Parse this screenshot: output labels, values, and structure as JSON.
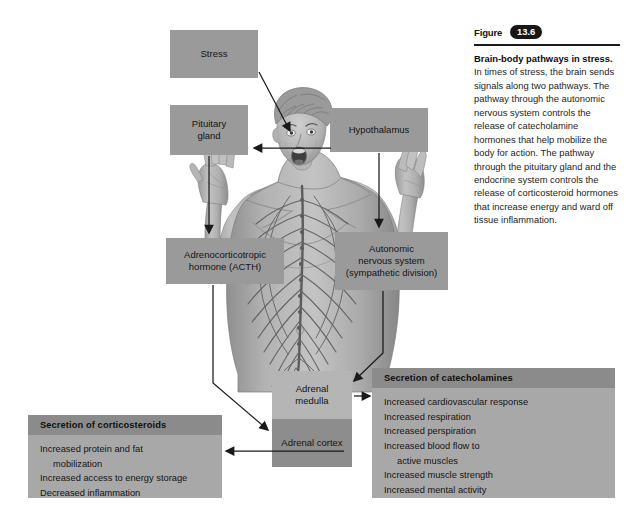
{
  "figure": {
    "label": "Figure",
    "number": "13.6",
    "title": "Brain-body pathways in stress.",
    "caption": " In times of stress, the brain sends signals along two pathways. The pathway through the autonomic nervous system controls the release of catecholamine hormones that help mobilize the body for action. The pathway through the pituitary gland and the endocrine system controls the release of corticosteroid hormones that increase energy and ward off tissue inflammation."
  },
  "diagram": {
    "boxes": {
      "stress": {
        "line1": "Stress"
      },
      "pituitary": {
        "line1": "Pituitary",
        "line2": "gland"
      },
      "hypothalamus": {
        "line1": "Hypothalamus"
      },
      "acth": {
        "line1": "Adrenocorticotropic",
        "line2": "hormone (ACTH)"
      },
      "autonomic": {
        "line1": "Autonomic",
        "line2": "nervous system",
        "line3": "(sympathetic division)"
      },
      "adrenal_medulla": {
        "line1": "Adrenal",
        "line2": "medulla"
      },
      "adrenal_cortex": {
        "line1": "Adrenal cortex"
      }
    },
    "panels": {
      "catecholamines": {
        "header": "Secretion of catecholamines",
        "items": [
          {
            "text": "Increased cardiovascular response",
            "indent": false
          },
          {
            "text": "Increased respiration",
            "indent": false
          },
          {
            "text": "Increased perspiration",
            "indent": false
          },
          {
            "text": "Increased blood flow to",
            "indent": false
          },
          {
            "text": "active muscles",
            "indent": true
          },
          {
            "text": "Increased muscle strength",
            "indent": false
          },
          {
            "text": "Increased mental activity",
            "indent": false
          }
        ]
      },
      "corticosteroids": {
        "header": "Secretion of corticosteroids",
        "items": [
          {
            "text": "Increased protein and fat",
            "indent": false
          },
          {
            "text": "mobilization",
            "indent": true
          },
          {
            "text": "Increased access to energy storage",
            "indent": false
          },
          {
            "text": "Decreased inflammation",
            "indent": false
          }
        ]
      }
    },
    "colors": {
      "box_default": "#9a9a9a",
      "box_light": "#b5b5b5",
      "box_dark": "#8d8d8d",
      "panel_body": "#a8a8a8",
      "panel_header": "#8b8b8b",
      "arrow": "#1a1a1a",
      "background": "#ffffff"
    },
    "illustration": {
      "name": "human-figure-nervous-system",
      "description": "Grayscale anatomical illustration of a man with arms raised and mouth open, showing the nervous system"
    }
  }
}
